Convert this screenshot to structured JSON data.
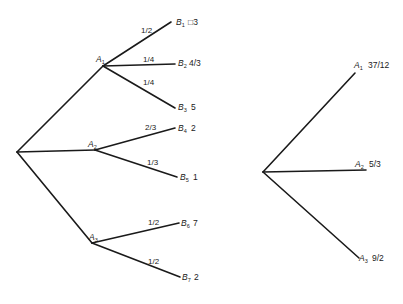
{
  "left_tree": {
    "root": {
      "x": 17,
      "y": 152
    },
    "a_nodes": [
      {
        "id": "A1",
        "letter": "A",
        "sub": "1",
        "x": 103,
        "y": 66
      },
      {
        "id": "A2",
        "letter": "A",
        "sub": "2",
        "x": 95,
        "y": 150
      },
      {
        "id": "A3",
        "letter": "A",
        "sub": "3",
        "x": 92,
        "y": 243
      }
    ],
    "b_nodes": [
      {
        "id": "B1",
        "letter": "B",
        "sub": "1",
        "value": "□3",
        "prob": "1/2",
        "parent": 0,
        "x": 171,
        "y": 21
      },
      {
        "id": "B2",
        "letter": "B",
        "sub": "2",
        "value": "4/3",
        "prob": "1/4",
        "parent": 0,
        "x": 175,
        "y": 64
      },
      {
        "id": "B3",
        "letter": "B",
        "sub": "3",
        "value": "5",
        "prob": "1/4",
        "parent": 0,
        "x": 175,
        "y": 108
      },
      {
        "id": "B4",
        "letter": "B",
        "sub": "4",
        "value": "2",
        "prob": "2/3",
        "parent": 1,
        "x": 175,
        "y": 128
      },
      {
        "id": "B5",
        "letter": "B",
        "sub": "5",
        "value": "1",
        "prob": "1/3",
        "parent": 1,
        "x": 177,
        "y": 177
      },
      {
        "id": "B6",
        "letter": "B",
        "sub": "6",
        "value": "7",
        "prob": "1/2",
        "parent": 2,
        "x": 179,
        "y": 223
      },
      {
        "id": "B7",
        "letter": "B",
        "sub": "7",
        "value": "2",
        "prob": "1/2",
        "parent": 2,
        "x": 180,
        "y": 277
      }
    ]
  },
  "right_tree": {
    "root": {
      "x": 263,
      "y": 172
    },
    "nodes": [
      {
        "id": "A1",
        "letter": "A",
        "sub": "1",
        "value": "37/12",
        "x": 355,
        "y": 73
      },
      {
        "id": "A2",
        "letter": "A",
        "sub": "2",
        "value": "5/3",
        "x": 366,
        "y": 170
      },
      {
        "id": "A3",
        "letter": "A",
        "sub": "3",
        "value": "9/2",
        "x": 359,
        "y": 258
      }
    ]
  }
}
